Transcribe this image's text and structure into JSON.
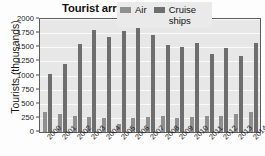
{
  "chart_data": {
    "type": "bar",
    "title": "Tourist arrivals, 2000–2014",
    "xlabel": "",
    "ylabel": "Tourists (thousands)",
    "ylim": [
      0,
      2000
    ],
    "yticks": [
      0,
      250,
      500,
      750,
      1000,
      1250,
      1500,
      1750,
      2000
    ],
    "ytick_labels": [
      "0",
      "250",
      "500",
      "750",
      "1000",
      "1250",
      "1500",
      "1750",
      "2000"
    ],
    "grid": true,
    "grid_axis": "y",
    "legend_position": "top-right",
    "categories": [
      "2000",
      "2001",
      "2002",
      "2003",
      "2004",
      "2005",
      "2006",
      "2007",
      "2008",
      "2009",
      "2010",
      "2011",
      "2012",
      "2013",
      "2014"
    ],
    "series": [
      {
        "name": "Air",
        "color": "#8f8f8f",
        "values": [
          350,
          320,
          290,
          270,
          240,
          145,
          255,
          270,
          290,
          255,
          270,
          285,
          285,
          320,
          360
        ]
      },
      {
        "name": "Cruise ships",
        "color": "#6e6e6e",
        "values": [
          1020,
          1205,
          1565,
          1810,
          1690,
          1790,
          1910,
          1710,
          1535,
          1510,
          1575,
          1385,
          1495,
          1350,
          1580
        ]
      }
    ],
    "plot_background": "#e7e7e7",
    "gridline_color": "#fafafa",
    "axis_color": "#5d5d5d"
  }
}
